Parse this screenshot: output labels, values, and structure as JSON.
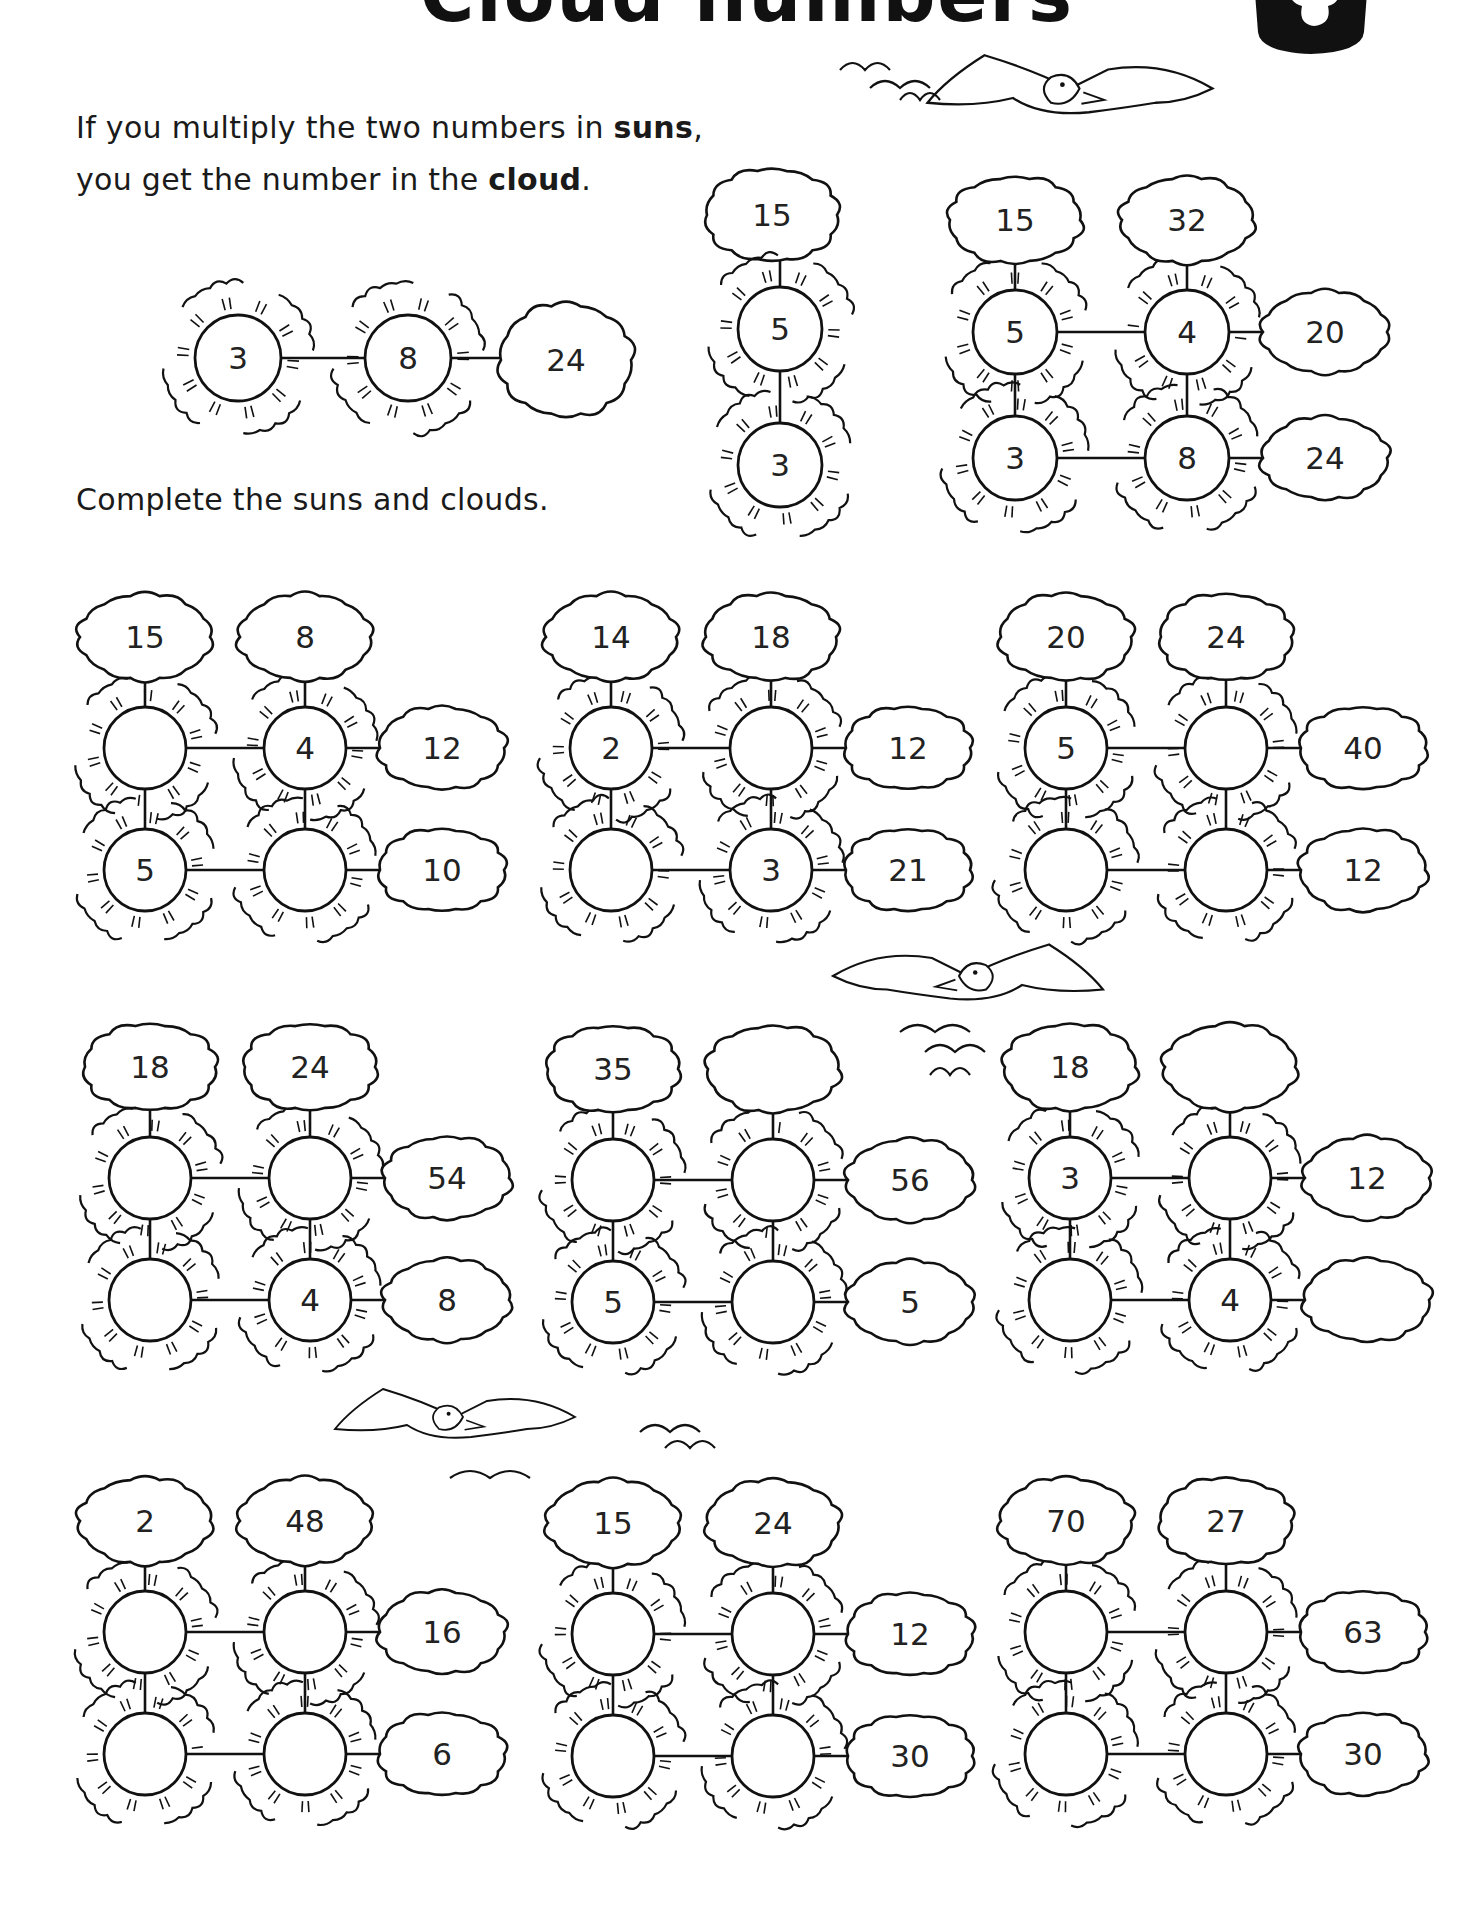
{
  "page": {
    "title": "Cloud numbers",
    "instructions": {
      "line1_pre": "If you multiply the two numbers in ",
      "line1_bold": "suns",
      "line1_post": ",",
      "line2_pre": "you get the number in the ",
      "line2_bold": "cloud",
      "line2_post": ".",
      "task": "Complete the suns and clouds."
    },
    "colors": {
      "ink": "#111111",
      "paper": "#ffffff"
    },
    "icons": [
      "cloud-logo-icon",
      "sun-icon",
      "cloud-icon",
      "bird-icon"
    ]
  },
  "examples": [
    {
      "type": "row",
      "suns": [
        "3",
        "8"
      ],
      "cloud": "24"
    },
    {
      "type": "column",
      "cloud": "15",
      "suns": [
        "5",
        "3"
      ]
    },
    {
      "type": "grid",
      "suns": {
        "tl": "5",
        "tr": "4",
        "bl": "3",
        "br": "8"
      },
      "top_clouds": [
        "15",
        "32"
      ],
      "right_clouds": [
        "20",
        "24"
      ]
    }
  ],
  "puzzles": [
    {
      "suns": {
        "tl": "",
        "tr": "4",
        "bl": "5",
        "br": ""
      },
      "top_clouds": [
        "15",
        "8"
      ],
      "right_clouds": [
        "12",
        "10"
      ]
    },
    {
      "suns": {
        "tl": "2",
        "tr": "",
        "bl": "",
        "br": "3"
      },
      "top_clouds": [
        "14",
        "18"
      ],
      "right_clouds": [
        "12",
        "21"
      ]
    },
    {
      "suns": {
        "tl": "5",
        "tr": "",
        "bl": "",
        "br": ""
      },
      "top_clouds": [
        "20",
        "24"
      ],
      "right_clouds": [
        "40",
        "12"
      ]
    },
    {
      "suns": {
        "tl": "",
        "tr": "",
        "bl": "",
        "br": "4"
      },
      "top_clouds": [
        "18",
        "24"
      ],
      "right_clouds": [
        "54",
        "8"
      ]
    },
    {
      "suns": {
        "tl": "",
        "tr": "",
        "bl": "5",
        "br": ""
      },
      "top_clouds": [
        "35",
        ""
      ],
      "right_clouds": [
        "56",
        "5"
      ]
    },
    {
      "suns": {
        "tl": "3",
        "tr": "",
        "bl": "",
        "br": "4"
      },
      "top_clouds": [
        "18",
        ""
      ],
      "right_clouds": [
        "12",
        ""
      ]
    },
    {
      "suns": {
        "tl": "",
        "tr": "",
        "bl": "",
        "br": ""
      },
      "top_clouds": [
        "2",
        "48"
      ],
      "right_clouds": [
        "16",
        "6"
      ]
    },
    {
      "suns": {
        "tl": "",
        "tr": "",
        "bl": "",
        "br": ""
      },
      "top_clouds": [
        "15",
        "24"
      ],
      "right_clouds": [
        "12",
        "30"
      ]
    },
    {
      "suns": {
        "tl": "",
        "tr": "",
        "bl": "",
        "br": ""
      },
      "top_clouds": [
        "70",
        "27"
      ],
      "right_clouds": [
        "63",
        "30"
      ]
    }
  ]
}
